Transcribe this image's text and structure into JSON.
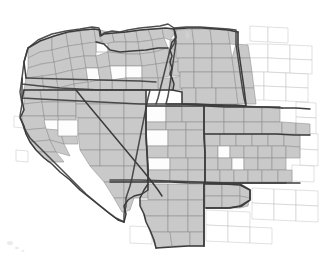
{
  "figure": {
    "kind": "map",
    "description": "Grayscale raster county map of the western United States with thick state outlines; most counties shaded light gray, a subset left white.",
    "width": 320,
    "height": 258,
    "background_color": "#ffffff"
  },
  "legend_colors": {
    "shaded_county_fill": "#c9c9c9",
    "unshaded_county_fill": "#fdfdfd",
    "county_border": "#8e8e8e",
    "state_border": "#3c3c3c",
    "outside_county_border": "#c2c2c2"
  },
  "states": [
    {
      "name": "Washington",
      "abbr": "WA"
    },
    {
      "name": "Oregon",
      "abbr": "OR"
    },
    {
      "name": "California",
      "abbr": "CA"
    },
    {
      "name": "Nevada",
      "abbr": "NV"
    },
    {
      "name": "Idaho",
      "abbr": "ID"
    },
    {
      "name": "Montana",
      "abbr": "MT"
    },
    {
      "name": "Wyoming",
      "abbr": "WY"
    },
    {
      "name": "Utah",
      "abbr": "UT"
    },
    {
      "name": "Colorado",
      "abbr": "CO"
    },
    {
      "name": "Arizona",
      "abbr": "AZ"
    },
    {
      "name": "New Mexico",
      "abbr": "NM"
    }
  ],
  "labels": {
    "title": "",
    "subtitle": "",
    "caption": "",
    "scale_bar": "",
    "north_arrow": "",
    "legend_title": ""
  },
  "geometry": {
    "state_outlines": [
      {
        "name": "oregon-washington-idaho-block",
        "d": "M 22 78 L 24 62 L 28 48 L 38 40 L 52 34 L 66 31 L 80 29 L 92 27 L 99 28 L 100 36 L 104 33 L 112 31 L 120 32 L 128 30 L 140 28 L 150 27 L 160 26 L 168 24 L 174 28 L 176 36 L 174 44 L 170 50 L 168 58 L 166 66 L 164 74 L 162 82 L 160 90 L 158 98 L 156 104 L 140 104 L 120 103 L 100 102 L 80 101 L 60 100 L 40 99 L 22 98 Z"
      },
      {
        "name": "montana-wyoming-block",
        "d": "M 174 28 L 186 27 L 200 27 L 214 28 L 228 29 L 236 30 L 236 44 L 238 58 L 240 72 L 242 86 L 244 98 L 246 106 L 230 106 L 214 105 L 198 105 L 182 104 L 166 104 L 168 96 L 170 84 L 172 70 L 174 56 L 176 42 Z"
      },
      {
        "name": "california-nevada-outline",
        "d": "M 22 78 L 20 92 L 22 104 L 20 116 L 24 128 L 30 138 L 40 148 L 50 158 L 62 170 L 74 182 L 86 194 L 98 204 L 108 212 L 116 218 L 124 222 L 124 214 L 126 206 L 126 198 L 128 192 L 130 186 L 132 178 L 134 168 L 136 158 L 138 148 L 140 138 L 142 128 L 144 118 L 146 108 L 148 98 L 150 90 L 140 90 L 120 90 L 100 90 L 80 89 L 60 88 L 40 86 L 22 84 Z"
      },
      {
        "name": "great-basin-south-line",
        "d": "M 26 78 L 60 79 L 100 80 L 140 81 L 156 82"
      },
      {
        "name": "utah-colorado-north-line",
        "d": "M 156 104 L 180 104 L 210 105 L 240 106 L 262 107 L 280 107"
      },
      {
        "name": "arizona-newmexico-north-line",
        "d": "M 110 180 L 140 180 L 170 181 L 200 182 L 230 183 L 260 183 L 286 183"
      },
      {
        "name": "utah-nevada-west-line",
        "d": "M 146 108 L 146 130 L 147 150 L 148 166 L 148 180"
      },
      {
        "name": "colorado-utah-east-line",
        "d": "M 204 106 L 204 130 L 205 152 L 205 172 L 205 182"
      },
      {
        "name": "newmexico-arizona-divide",
        "d": "M 204 183 L 204 200 L 204 216 L 204 230 L 204 246"
      },
      {
        "name": "newmexico-north-east-step",
        "d": "M 205 183 L 222 184 L 240 184 L 250 190 L 250 200 L 240 206 L 228 208 L 216 208 L 206 208"
      }
    ],
    "noise_marks": [
      {
        "cx": 10,
        "cy": 243,
        "r": 2.0
      },
      {
        "cx": 16,
        "cy": 247,
        "r": 1.4
      },
      {
        "cx": 22,
        "cy": 250,
        "r": 1.1
      },
      {
        "cx": 186,
        "cy": 36,
        "r": 1.0
      },
      {
        "cx": 190,
        "cy": 40,
        "r": 0.9
      }
    ]
  }
}
